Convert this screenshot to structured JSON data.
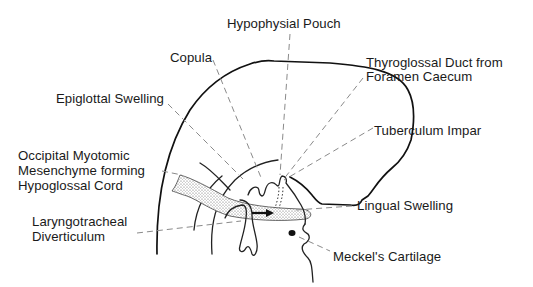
{
  "diagram": {
    "labels": {
      "hypophysial_pouch": "Hypophysial Pouch",
      "copula": "Copula",
      "thyroglossal_line1": "Thyroglossal Duct from",
      "thyroglossal_line2": "Foramen Caecum",
      "epiglottal_swelling": "Epiglottal Swelling",
      "tuberculum_impar": "Tuberculum Impar",
      "occipital_line1": "Occipital Myotomic",
      "occipital_line2": "Mesenchyme forming",
      "occipital_line3": "Hypoglossal Cord",
      "lingual_swelling": "Lingual Swelling",
      "laryngo_line1": "Laryngotracheal",
      "laryngo_line2": "Diverticulum",
      "meckels_cartilage": "Meckel's Cartilage"
    },
    "colors": {
      "outline": "#111111",
      "leader": "#8a8a8a",
      "stipple": "#b8b8b8"
    }
  }
}
